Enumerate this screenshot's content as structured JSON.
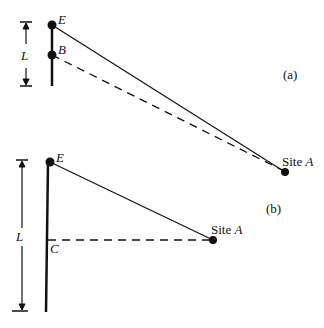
{
  "figure_a": {
    "label": "(a)",
    "points": {
      "E": {
        "name": "E"
      },
      "B": {
        "name": "B"
      },
      "site": {
        "prefix": "Site ",
        "name": "A"
      }
    },
    "dimension_label": "L"
  },
  "figure_b": {
    "label": "(b)",
    "points": {
      "E": {
        "name": "E"
      },
      "C": {
        "name": "C"
      },
      "site": {
        "prefix": "Site ",
        "name": "A"
      }
    },
    "dimension_label": "L"
  },
  "colors": {
    "ink": "#111111",
    "background": "#ffffff"
  }
}
